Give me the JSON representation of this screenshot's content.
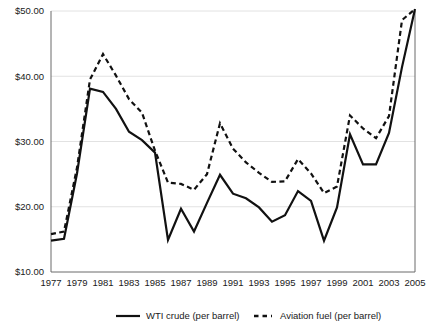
{
  "chart_data": {
    "type": "line",
    "title": "",
    "subtitle": "",
    "xlabel": "",
    "ylabel": "",
    "grid": "horizontal",
    "legend_position": "bottom",
    "xlim": [
      1977,
      2005
    ],
    "ylim": [
      10,
      50
    ],
    "y_ticks": [
      10,
      20,
      30,
      40,
      50
    ],
    "y_tick_labels": [
      "$10.00",
      "$20.00",
      "$30.00",
      "$40.00",
      "$50.00"
    ],
    "x_ticks": [
      1977,
      1979,
      1981,
      1983,
      1985,
      1987,
      1989,
      1991,
      1993,
      1995,
      1997,
      1999,
      2001,
      2003,
      2005
    ],
    "x_tick_labels": [
      "1977",
      "1979",
      "1981",
      "1983",
      "1985",
      "1987",
      "1989",
      "1991",
      "1993",
      "1995",
      "1997",
      "1999",
      "2001",
      "2003",
      "2005"
    ],
    "x": [
      1977,
      1978,
      1979,
      1980,
      1981,
      1982,
      1983,
      1984,
      1985,
      1986,
      1987,
      1988,
      1989,
      1990,
      1991,
      1992,
      1993,
      1994,
      1995,
      1996,
      1997,
      1998,
      1999,
      2000,
      2001,
      2002,
      2003,
      2004,
      2005
    ],
    "series": [
      {
        "name": "WTI crude (per barrel)",
        "style": "solid",
        "color": "#111111",
        "values": [
          14.8,
          15.1,
          25.1,
          38.1,
          37.6,
          35.0,
          31.5,
          30.2,
          28.3,
          14.9,
          19.7,
          16.2,
          20.6,
          24.9,
          22.0,
          21.3,
          19.9,
          17.7,
          18.7,
          22.4,
          20.9,
          14.8,
          19.9,
          31.1,
          26.5,
          26.5,
          31.3,
          41.4,
          50.3
        ]
      },
      {
        "name": "Aviation fuel (per barrel)",
        "style": "dashed",
        "color": "#111111",
        "values": [
          15.8,
          16.2,
          26.0,
          39.5,
          43.4,
          40.1,
          36.5,
          34.4,
          28.6,
          23.7,
          23.5,
          22.6,
          25.0,
          32.8,
          28.9,
          26.8,
          25.2,
          23.8,
          23.9,
          27.3,
          25.1,
          22.1,
          23.1,
          34.0,
          32.0,
          30.5,
          33.9,
          48.6,
          50.3
        ]
      }
    ],
    "legend": [
      {
        "label": "WTI crude (per barrel)",
        "style": "solid"
      },
      {
        "label": "Aviation fuel (per barrel)",
        "style": "dashed"
      }
    ]
  }
}
